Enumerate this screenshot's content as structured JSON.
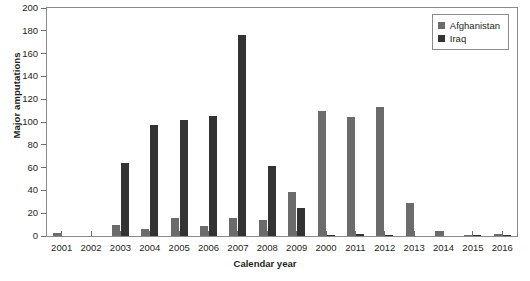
{
  "chart_data": {
    "type": "bar",
    "title": "",
    "xlabel": "Calendar year",
    "ylabel": "Major amputations",
    "categories": [
      "2001",
      "2002",
      "2003",
      "2004",
      "2005",
      "2006",
      "2007",
      "2008",
      "2009",
      "2000",
      "2011",
      "2012",
      "2013",
      "2014",
      "2015",
      "2016"
    ],
    "series": [
      {
        "name": "Afghanistan",
        "color": "#6b6b6b",
        "values": [
          3,
          0,
          10,
          6,
          16,
          9,
          16,
          14,
          39,
          110,
          104,
          113,
          29,
          4,
          1,
          2
        ]
      },
      {
        "name": "Iraq",
        "color": "#333333",
        "values": [
          0,
          0,
          64,
          97,
          102,
          105,
          176,
          61,
          25,
          1,
          2,
          1,
          0,
          0,
          1,
          1
        ]
      }
    ],
    "ylim": [
      0,
      200
    ],
    "yticks": [
      0,
      20,
      40,
      60,
      80,
      100,
      120,
      140,
      160,
      180,
      200
    ],
    "grid": false,
    "legend_position": "top-right",
    "legend": [
      "Afghanistan",
      "Iraq"
    ]
  },
  "axis": {
    "y_title": "Major amputations",
    "x_title": "Calendar year"
  }
}
